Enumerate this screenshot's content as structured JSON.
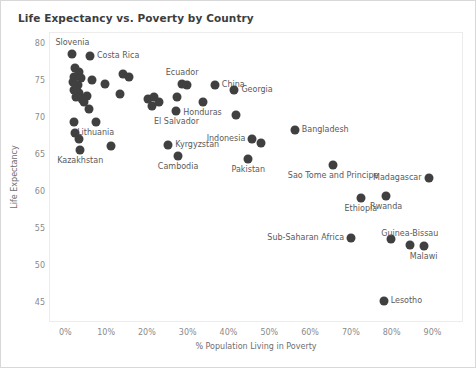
{
  "chart_data": {
    "type": "scatter",
    "title": "Life Expectancy vs. Poverty by Country",
    "xlabel": "% Population Living in Poverty",
    "ylabel": "Life Expectancy",
    "xlim": [
      -4,
      97
    ],
    "ylim": [
      42.5,
      81.5
    ],
    "xticks": [
      "0%",
      "10%",
      "20%",
      "30%",
      "40%",
      "50%",
      "60%",
      "70%",
      "80%",
      "90%"
    ],
    "xtick_values": [
      0,
      10,
      20,
      30,
      40,
      50,
      60,
      70,
      80,
      90
    ],
    "yticks": [
      "80",
      "75",
      "70",
      "65",
      "60",
      "55",
      "50",
      "45"
    ],
    "ytick_values": [
      80,
      75,
      70,
      65,
      60,
      55,
      50,
      45
    ],
    "grid": false,
    "legend": "none",
    "marker_color": "#404040",
    "marker_size": 9,
    "points": [
      {
        "label": "Slovenia",
        "anno": "above",
        "x": 1.5,
        "y": 78.6
      },
      {
        "label": "Costa Rica",
        "anno": "right",
        "x": 5.8,
        "y": 78.4
      },
      {
        "label": "",
        "anno": "none",
        "x": 2.2,
        "y": 76.8
      },
      {
        "label": "",
        "anno": "none",
        "x": 3.2,
        "y": 76.2
      },
      {
        "label": "",
        "anno": "none",
        "x": 2.0,
        "y": 75.6
      },
      {
        "label": "",
        "anno": "none",
        "x": 3.6,
        "y": 75.4
      },
      {
        "label": "",
        "anno": "none",
        "x": 1.6,
        "y": 74.8
      },
      {
        "label": "",
        "anno": "none",
        "x": 2.8,
        "y": 74.4
      },
      {
        "label": "",
        "anno": "none",
        "x": 1.8,
        "y": 73.8
      },
      {
        "label": "",
        "anno": "none",
        "x": 3.0,
        "y": 73.4
      },
      {
        "label": "",
        "anno": "none",
        "x": 2.4,
        "y": 72.8
      },
      {
        "label": "",
        "anno": "none",
        "x": 3.8,
        "y": 72.6
      },
      {
        "label": "",
        "anno": "none",
        "x": 5.0,
        "y": 73.0
      },
      {
        "label": "",
        "anno": "none",
        "x": 4.4,
        "y": 72.2
      },
      {
        "label": "",
        "anno": "none",
        "x": 6.4,
        "y": 75.2
      },
      {
        "label": "",
        "anno": "none",
        "x": 9.6,
        "y": 74.6
      },
      {
        "label": "",
        "anno": "none",
        "x": 5.6,
        "y": 71.2
      },
      {
        "label": "",
        "anno": "none",
        "x": 14.0,
        "y": 76.0
      },
      {
        "label": "",
        "anno": "none",
        "x": 15.4,
        "y": 75.6
      },
      {
        "label": "",
        "anno": "none",
        "x": 13.2,
        "y": 73.2
      },
      {
        "label": "",
        "anno": "none",
        "x": 20.0,
        "y": 72.6
      },
      {
        "label": "",
        "anno": "none",
        "x": 21.6,
        "y": 72.8
      },
      {
        "label": "",
        "anno": "none",
        "x": 22.8,
        "y": 72.2
      },
      {
        "label": "",
        "anno": "none",
        "x": 21.0,
        "y": 71.6
      },
      {
        "label": "Ecuador",
        "anno": "above",
        "x": 28.4,
        "y": 74.6
      },
      {
        "label": "",
        "anno": "none",
        "x": 29.6,
        "y": 74.4
      },
      {
        "label": "",
        "anno": "none",
        "x": 27.2,
        "y": 72.8
      },
      {
        "label": "El Salvador",
        "anno": "below",
        "x": 27.0,
        "y": 71.0
      },
      {
        "label": "China",
        "anno": "right",
        "x": 36.4,
        "y": 74.4
      },
      {
        "label": "Honduras",
        "anno": "below",
        "x": 33.4,
        "y": 72.2
      },
      {
        "label": "Georgia",
        "anno": "right",
        "x": 41.2,
        "y": 73.8
      },
      {
        "label": "",
        "anno": "none",
        "x": 41.6,
        "y": 70.4
      },
      {
        "label": "Lithuania",
        "anno": "below",
        "x": 7.2,
        "y": 69.4
      },
      {
        "label": "",
        "anno": "none",
        "x": 2.0,
        "y": 69.4
      },
      {
        "label": "",
        "anno": "none",
        "x": 2.2,
        "y": 68.0
      },
      {
        "label": "",
        "anno": "none",
        "x": 3.0,
        "y": 67.2
      },
      {
        "label": "Kazakhstan",
        "anno": "below",
        "x": 3.4,
        "y": 65.6
      },
      {
        "label": "",
        "anno": "none",
        "x": 11.0,
        "y": 66.2
      },
      {
        "label": "Kyrgyzstan",
        "anno": "right",
        "x": 25.0,
        "y": 66.4
      },
      {
        "label": "Cambodia",
        "anno": "below",
        "x": 27.4,
        "y": 64.8
      },
      {
        "label": "Indonesia",
        "anno": "left",
        "x": 45.6,
        "y": 67.2
      },
      {
        "label": "",
        "anno": "none",
        "x": 47.8,
        "y": 66.6
      },
      {
        "label": "Bangladesh",
        "anno": "right",
        "x": 56.0,
        "y": 68.4
      },
      {
        "label": "Pakistan",
        "anno": "below",
        "x": 44.6,
        "y": 64.4
      },
      {
        "label": "Sao Tome and Principe",
        "anno": "below",
        "x": 65.4,
        "y": 63.6
      },
      {
        "label": "Madagascar",
        "anno": "left",
        "x": 88.8,
        "y": 61.8
      },
      {
        "label": "Ethiopia",
        "anno": "below",
        "x": 72.2,
        "y": 59.2
      },
      {
        "label": "Rwanda",
        "anno": "below",
        "x": 78.4,
        "y": 59.4
      },
      {
        "label": "Sub-Saharan Africa",
        "anno": "left",
        "x": 69.8,
        "y": 53.8
      },
      {
        "label": "",
        "anno": "none",
        "x": 79.6,
        "y": 53.6
      },
      {
        "label": "Guinea-Bissau",
        "anno": "above",
        "x": 84.2,
        "y": 52.8
      },
      {
        "label": "Malawi",
        "anno": "below",
        "x": 87.6,
        "y": 52.6
      },
      {
        "label": "Lesotho",
        "anno": "right",
        "x": 77.8,
        "y": 45.2
      }
    ]
  }
}
